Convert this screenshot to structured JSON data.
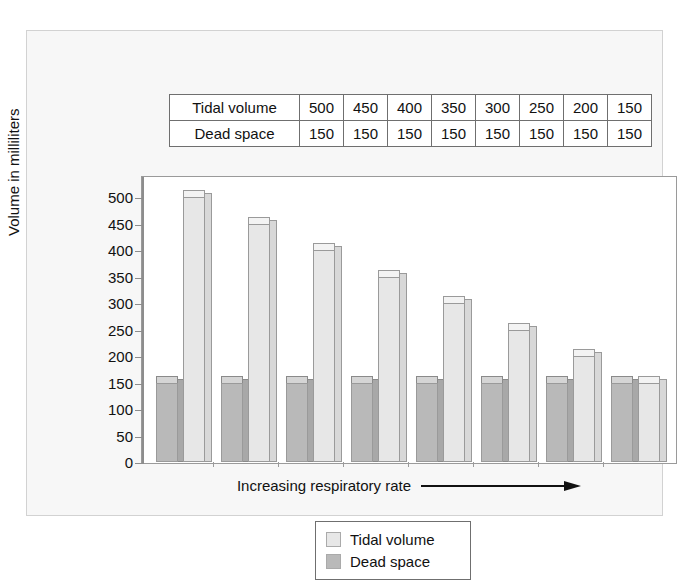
{
  "table": {
    "rows": [
      {
        "label": "Tidal volume",
        "values": [
          "500",
          "450",
          "400",
          "350",
          "300",
          "250",
          "200",
          "150"
        ]
      },
      {
        "label": "Dead space",
        "values": [
          "150",
          "150",
          "150",
          "150",
          "150",
          "150",
          "150",
          "150"
        ]
      }
    ]
  },
  "chart_data": {
    "type": "bar",
    "title": "",
    "xlabel": "Increasing respiratory rate",
    "ylabel": "Volume in milliliters",
    "ylim": [
      0,
      500
    ],
    "yticks": [
      0,
      50,
      100,
      150,
      200,
      250,
      300,
      350,
      400,
      450,
      500
    ],
    "ytick_labels": [
      "0",
      "50",
      "100",
      "150",
      "200",
      "250",
      "300",
      "350",
      "400",
      "450",
      "500"
    ],
    "grid": false,
    "legend_position": "bottom-center",
    "categories": [
      "1",
      "2",
      "3",
      "4",
      "5",
      "6",
      "7",
      "8"
    ],
    "series": [
      {
        "name": "Dead space",
        "color": "#b9b9b9",
        "values": [
          150,
          150,
          150,
          150,
          150,
          150,
          150,
          150
        ]
      },
      {
        "name": "Tidal volume",
        "color": "#e7e7e7",
        "values": [
          500,
          450,
          400,
          350,
          300,
          250,
          200,
          150
        ]
      }
    ],
    "annotations": [
      "arrow pointing right after x-axis label"
    ]
  },
  "axis": {
    "y_title": "Volume in milliliters",
    "x_caption": "Increasing respiratory rate"
  },
  "legend": {
    "items": [
      {
        "label": "Tidal volume",
        "color": "#e7e7e7"
      },
      {
        "label": "Dead space",
        "color": "#b9b9b9"
      }
    ]
  }
}
